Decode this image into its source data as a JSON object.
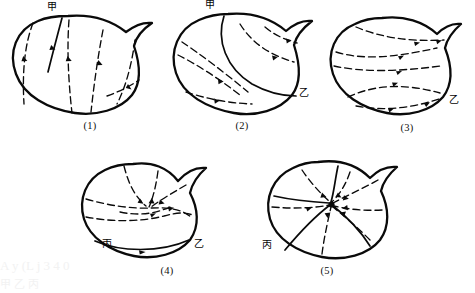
{
  "page": {
    "background_color": "#ffffff",
    "ink_color": "#0a0a0a",
    "width": 475,
    "height": 293
  },
  "figures": [
    {
      "id": "figure-1",
      "caption": "(1)",
      "labels": [
        {
          "name": "label-jia",
          "text": "甲",
          "position": "top"
        }
      ],
      "description": "Bean-shaped closed region with one short solid curve descending from the top boundary point and four dashed flow curves with arrowheads.",
      "solid_curve_count": 1,
      "dashed_curve_count": 4,
      "arrow_count": 4
    },
    {
      "id": "figure-2",
      "caption": "(2)",
      "labels": [
        {
          "name": "label-jia",
          "text": "甲",
          "position": "top"
        },
        {
          "name": "label-yi",
          "text": "乙",
          "position": "right"
        }
      ],
      "description": "Bean-shaped closed region with one solid curve running from the top point to the right point, and dashed flow curves with arrowheads on both sides.",
      "solid_curve_count": 1,
      "dashed_curve_count": 5,
      "arrow_count": 5
    },
    {
      "id": "figure-3",
      "caption": "(3)",
      "labels": [
        {
          "name": "label-yi",
          "text": "乙",
          "position": "bottom-right"
        }
      ],
      "description": "Bean-shaped closed region with four dashed flow curves, all arrowheads pointing rightward toward the lower-right boundary point.",
      "solid_curve_count": 0,
      "dashed_curve_count": 4,
      "arrow_count": 7
    },
    {
      "id": "figure-4",
      "caption": "(4)",
      "labels": [
        {
          "name": "label-bing",
          "text": "丙",
          "position": "bottom-left"
        },
        {
          "name": "label-yi",
          "text": "乙",
          "position": "bottom-right"
        }
      ],
      "description": "Bean-shaped closed region with a solid arc joining the lower-left and lower-right boundary points, plus dashed flow curves converging at an interior node.",
      "solid_curve_count": 1,
      "dashed_curve_count": 5,
      "arrow_count": 5
    },
    {
      "id": "figure-5",
      "caption": "(5)",
      "labels": [
        {
          "name": "label-bing",
          "text": "丙",
          "position": "bottom-left"
        }
      ],
      "description": "Bean-shaped closed region with solid curves and dashed flow curves radiating from a single interior focus point; arrowheads point inward toward the focus.",
      "solid_curve_count": 4,
      "dashed_curve_count": 6,
      "arrow_count": 6
    }
  ],
  "watermark": {
    "visible": true,
    "lines": [
      "A y (L j  3 4 0",
      "甲  乙  丙"
    ],
    "color": "#f3f3f3"
  }
}
